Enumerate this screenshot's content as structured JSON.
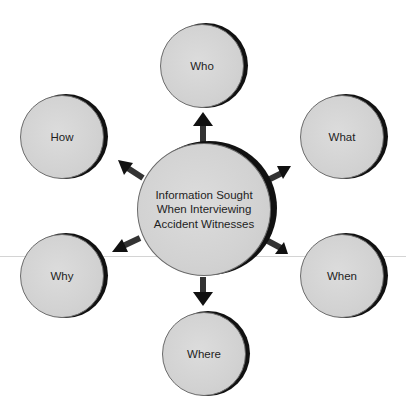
{
  "diagram": {
    "center": {
      "label": "Information Sought When Interviewing Accident Witnesses"
    },
    "nodes": [
      {
        "id": "who",
        "label": "Who"
      },
      {
        "id": "what",
        "label": "What"
      },
      {
        "id": "when",
        "label": "When"
      },
      {
        "id": "where",
        "label": "Where"
      },
      {
        "id": "why",
        "label": "Why"
      },
      {
        "id": "how",
        "label": "How"
      }
    ]
  },
  "colors": {
    "circle_fill": "#d2d2d2",
    "rim": "#111111",
    "arrow": "#111111",
    "text": "#1e1e1e"
  }
}
